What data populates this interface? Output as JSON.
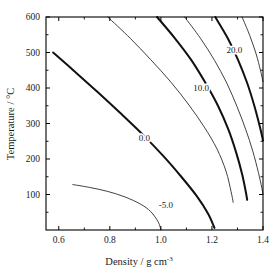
{
  "chart_data": {
    "type": "line",
    "title": "",
    "xlabel": "Density / g cm-3",
    "xlabel_main": "Density / g cm",
    "xlabel_exponent": "-3",
    "ylabel": "Temperature / °C",
    "xlim": [
      0.55,
      1.4
    ],
    "ylim": [
      0,
      600
    ],
    "xticks": [
      0.6,
      0.8,
      1.0,
      1.2,
      1.4
    ],
    "xticklabels": [
      "0.6",
      "0.8",
      "1.0",
      "1.2",
      "1.4"
    ],
    "yticks": [
      100,
      200,
      300,
      400,
      500,
      600
    ],
    "yticklabels": [
      "100",
      "200",
      "300",
      "400",
      "500",
      "600"
    ],
    "x_minor_ticks": [
      0.7,
      0.9,
      1.1,
      1.3
    ],
    "y_minor_ticks": [
      50,
      150,
      250,
      350,
      450,
      550
    ],
    "grid": false,
    "legend": "none",
    "plot_kind": "contour",
    "contours": [
      {
        "level": "-5.0",
        "label": "-5.0",
        "weight": "thin",
        "label_x": 1.02,
        "label_y": 62,
        "points": [
          [
            0.655,
            128
          ],
          [
            0.72,
            120
          ],
          [
            0.79,
            109
          ],
          [
            0.86,
            93
          ],
          [
            0.92,
            73
          ],
          [
            0.96,
            52
          ],
          [
            0.99,
            22
          ],
          [
            1.0,
            0
          ]
        ]
      },
      {
        "level": "0.0",
        "label": "0.0",
        "weight": "thick",
        "label_x": 0.935,
        "label_y": 252,
        "points": [
          [
            0.578,
            500
          ],
          [
            0.66,
            448
          ],
          [
            0.75,
            390
          ],
          [
            0.84,
            330
          ],
          [
            0.93,
            268
          ],
          [
            1.01,
            208
          ],
          [
            1.08,
            150
          ],
          [
            1.14,
            96
          ],
          [
            1.185,
            46
          ],
          [
            1.21,
            6
          ]
        ]
      },
      {
        "level": "5.0",
        "label": "",
        "weight": "thin",
        "label_x": null,
        "label_y": null,
        "points": [
          [
            0.792,
            600
          ],
          [
            0.88,
            540
          ],
          [
            0.96,
            480
          ],
          [
            1.04,
            416
          ],
          [
            1.11,
            352
          ],
          [
            1.17,
            290
          ],
          [
            1.22,
            228
          ],
          [
            1.255,
            166
          ],
          [
            1.275,
            108
          ],
          [
            1.283,
            78
          ]
        ]
      },
      {
        "level": "10.0",
        "label": "10.0",
        "weight": "thick",
        "label_x": 1.158,
        "label_y": 392,
        "points": [
          [
            0.985,
            600
          ],
          [
            1.055,
            540
          ],
          [
            1.12,
            478
          ],
          [
            1.175,
            414
          ],
          [
            1.225,
            348
          ],
          [
            1.265,
            282
          ],
          [
            1.295,
            218
          ],
          [
            1.318,
            158
          ],
          [
            1.332,
            110
          ],
          [
            1.338,
            85
          ]
        ]
      },
      {
        "level": "15.0",
        "label": "",
        "weight": "thin",
        "label_x": null,
        "label_y": null,
        "points": [
          [
            1.093,
            600
          ],
          [
            1.155,
            540
          ],
          [
            1.21,
            478
          ],
          [
            1.258,
            414
          ],
          [
            1.298,
            348
          ],
          [
            1.332,
            284
          ],
          [
            1.36,
            222
          ],
          [
            1.382,
            162
          ],
          [
            1.395,
            120
          ],
          [
            1.4,
            100
          ]
        ]
      },
      {
        "level": "20.0",
        "label": "20.0",
        "weight": "thick",
        "label_x": 1.288,
        "label_y": 498,
        "points": [
          [
            1.213,
            600
          ],
          [
            1.262,
            540
          ],
          [
            1.303,
            478
          ],
          [
            1.338,
            414
          ],
          [
            1.366,
            350
          ],
          [
            1.388,
            290
          ],
          [
            1.4,
            252
          ]
        ]
      },
      {
        "level": "25.0",
        "label": "",
        "weight": "thin",
        "label_x": null,
        "label_y": null,
        "points": [
          [
            1.318,
            600
          ],
          [
            1.348,
            548
          ],
          [
            1.373,
            496
          ],
          [
            1.39,
            450
          ],
          [
            1.4,
            418
          ]
        ]
      }
    ]
  }
}
